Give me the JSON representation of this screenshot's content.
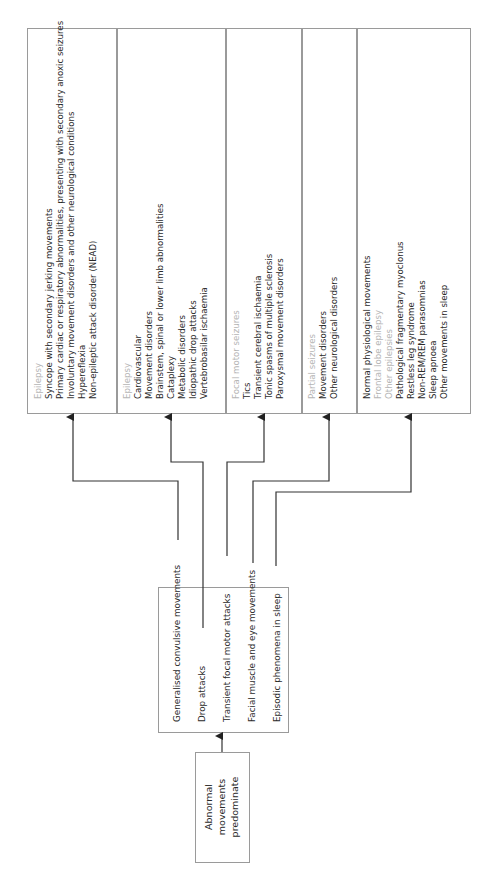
{
  "source": {
    "lines": [
      "Abnormal",
      "movements",
      "predominate"
    ]
  },
  "symptoms": [
    {
      "label": "Generalised convulsive movements"
    },
    {
      "label": "Drop attacks"
    },
    {
      "label": "Transient focal motor attacks"
    },
    {
      "label": "Facial muscle and eye movements"
    },
    {
      "label": "Episodic phenomena in sleep"
    }
  ],
  "differentials": [
    {
      "lines": [
        {
          "text": "Epilepsy",
          "style": "head"
        },
        {
          "text": "Syncope with secondary jerking movements",
          "style": "item"
        },
        {
          "text": "Primary cardiac or respiratory abnormalities, presenting with secondary anoxic seizures",
          "style": "item"
        },
        {
          "text": "Involuntary movement disorders and other neurological conditions",
          "style": "item"
        },
        {
          "text": "Hypereflexia",
          "style": "item"
        },
        {
          "text": "Non-epileptic attack disorder (NEAD)",
          "style": "item"
        }
      ]
    },
    {
      "lines": [
        {
          "text": "Epilepsy",
          "style": "head"
        },
        {
          "text": "Cardiovascular",
          "style": "item"
        },
        {
          "text": "Movement disorders",
          "style": "item"
        },
        {
          "text": "Brainstem, spinal or lower limb abnormalities",
          "style": "item"
        },
        {
          "text": "Cataplexy",
          "style": "item"
        },
        {
          "text": "Metabolic disorders",
          "style": "item"
        },
        {
          "text": "Idiopathic drop attacks",
          "style": "item"
        },
        {
          "text": "Vertebrobasilar ischaemia",
          "style": "item"
        }
      ]
    },
    {
      "lines": [
        {
          "text": "Focal motor seizures",
          "style": "head"
        },
        {
          "text": "Tics",
          "style": "item"
        },
        {
          "text": "Transient cerebral ischaemia",
          "style": "item"
        },
        {
          "text": "Tonic spasms of multiple sclerosis",
          "style": "item"
        },
        {
          "text": "Paroxysmal movement disorders",
          "style": "item"
        }
      ]
    },
    {
      "lines": [
        {
          "text": "Partial seizures",
          "style": "head"
        },
        {
          "text": "Movement disorders",
          "style": "item"
        },
        {
          "text": "Other neurological disorders",
          "style": "item"
        }
      ]
    },
    {
      "lines": [
        {
          "text": "Normal physiological movements",
          "style": "item"
        },
        {
          "text": "Frontal lobe epilepsy",
          "style": "sub"
        },
        {
          "text": "Other epilepsies",
          "style": "sub"
        },
        {
          "text": "Pathological fragmentary myoclonus",
          "style": "item"
        },
        {
          "text": "Restless leg syndrome",
          "style": "item"
        },
        {
          "text": "Non-REM/REM parasomnias",
          "style": "item"
        },
        {
          "text": "Sleep apnoea",
          "style": "item"
        },
        {
          "text": "Other movements in sleep",
          "style": "item"
        }
      ]
    }
  ],
  "colors": {
    "border": "#9a9a9a",
    "line": "#333333",
    "head_text": "#b5b5b5",
    "body_text": "#2a2a2a"
  }
}
